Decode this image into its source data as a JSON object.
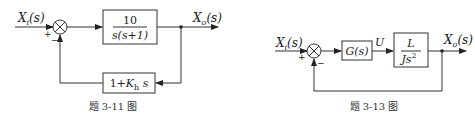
{
  "diagrams": [
    {
      "id": "3-11",
      "caption": "题 3-11 图",
      "input": {
        "base": "X",
        "sub": "i",
        "arg": "(s)"
      },
      "output": {
        "base": "X",
        "sub": "o",
        "arg": "(s)"
      },
      "summing_junction": {
        "plus": "+",
        "minus": "−"
      },
      "forward_block": {
        "numerator": "10",
        "denominator": "s(s+1)"
      },
      "feedback_block": {
        "prefix": "1+",
        "gain": "K",
        "gain_sub": "h",
        "suffix": " s"
      }
    },
    {
      "id": "3-13",
      "caption": "题 3-13 图",
      "input": {
        "base": "X",
        "sub": "i",
        "arg": "(s)"
      },
      "output": {
        "base": "X",
        "sub": "o",
        "arg": "(s)"
      },
      "summing_junction": {
        "plus": "+",
        "minus": "−"
      },
      "controller_block": {
        "label": "G(s)"
      },
      "signal_label": "U",
      "plant_block": {
        "numerator": "L",
        "denominator": "Js",
        "denominator_exp": "2"
      }
    }
  ],
  "colors": {
    "line": "#333333",
    "text": "#222222",
    "background": "#ffffff"
  }
}
